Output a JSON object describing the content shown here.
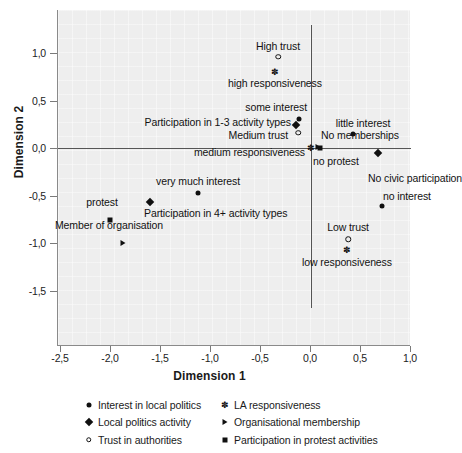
{
  "chart_data": {
    "type": "scatter",
    "title": "",
    "xlabel": "Dimension 1",
    "ylabel": "Dimension 2",
    "xlim": [
      -2.5,
      1.0
    ],
    "ylim": [
      -1.75,
      1.2
    ],
    "xticks": [
      "-2,5",
      "-2,0",
      "-1,5",
      "-1,0",
      "-0,5",
      "0,0",
      "0,5",
      "1,0"
    ],
    "xtick_values": [
      -2.5,
      -2.0,
      -1.5,
      -1.0,
      -0.5,
      0.0,
      0.5,
      1.0
    ],
    "yticks": [
      "1,0",
      "0,5",
      "0,0",
      "-0,5",
      "-1,0",
      "-1,5"
    ],
    "ytick_values": [
      1.0,
      0.5,
      0.0,
      -0.5,
      -1.0,
      -1.5
    ],
    "grid": false,
    "plot_background": "#eeeeee",
    "marker_color": "#101010",
    "origin_lines": true,
    "legend_position": "bottom",
    "points": [
      {
        "label": "High trust",
        "x": -0.33,
        "y": 0.96,
        "marker": "circle-open",
        "series": "Trust in authorities",
        "label_pos": "above-center"
      },
      {
        "label": "high responsiveness",
        "x": -0.36,
        "y": 0.8,
        "marker": "star",
        "series": "LA responsiveness",
        "label_pos": "below-center"
      },
      {
        "label": "some interest",
        "x": -0.12,
        "y": 0.31,
        "marker": "circle-filled",
        "series": "Interest in local politics",
        "label_pos": "above-left"
      },
      {
        "label": "Participation in 1-3 activity types",
        "x": -0.15,
        "y": 0.24,
        "marker": "diamond",
        "series": "Local politics activity",
        "label_pos": "left"
      },
      {
        "label": "Medium trust",
        "x": -0.13,
        "y": 0.16,
        "marker": "circle-open",
        "series": "Trust in authorities",
        "label_pos": "below-left"
      },
      {
        "label": "No memberships",
        "x": 0.07,
        "y": 0.01,
        "marker": "triangle",
        "series": "Organisational membership",
        "label_pos": "above-right"
      },
      {
        "label": "little interest",
        "x": 0.42,
        "y": 0.15,
        "marker": "circle-filled",
        "series": "Interest in local politics",
        "label_pos": "above-center"
      },
      {
        "label": "medium responsiveness",
        "x": 0.0,
        "y": 0.0,
        "marker": "star",
        "series": "LA responsiveness",
        "label_pos": "below-left"
      },
      {
        "label": "no protest",
        "x": 0.09,
        "y": 0.0,
        "marker": "square",
        "series": "Participation in protest activities",
        "label_pos": "below-right"
      },
      {
        "label": "No civic participation",
        "x": 0.67,
        "y": -0.05,
        "marker": "diamond",
        "series": "Local politics activity",
        "label_pos": "below-right"
      },
      {
        "label": "very much interest",
        "x": -1.13,
        "y": -0.47,
        "marker": "circle-filled",
        "series": "Interest in local politics",
        "label_pos": "above-center"
      },
      {
        "label": "no interest",
        "x": 0.71,
        "y": -0.61,
        "marker": "circle-filled",
        "series": "Interest in local politics",
        "label_pos": "above-right"
      },
      {
        "label": "Participation in 4+ activity types",
        "x": -1.61,
        "y": -0.57,
        "marker": "diamond",
        "series": "Local politics activity",
        "label_pos": "below-right"
      },
      {
        "label": "protest",
        "x": -2.01,
        "y": -0.76,
        "marker": "square",
        "series": "Participation in protest activities",
        "label_pos": "above-center"
      },
      {
        "label": "Member of organisation",
        "x": -1.88,
        "y": -1.0,
        "marker": "triangle",
        "series": "Organisational membership",
        "label_pos": "above-center"
      },
      {
        "label": "Low trust",
        "x": 0.37,
        "y": -0.96,
        "marker": "circle-open",
        "series": "Trust in authorities",
        "label_pos": "above-center"
      },
      {
        "label": "low responsiveness",
        "x": 0.36,
        "y": -1.07,
        "marker": "star",
        "series": "LA responsiveness",
        "label_pos": "below-center"
      }
    ],
    "legend": [
      {
        "label": "Interest in local politics",
        "marker": "circle-filled"
      },
      {
        "label": "LA responsiveness",
        "marker": "star"
      },
      {
        "label": "Local politics activity",
        "marker": "diamond"
      },
      {
        "label": "Organisational membership",
        "marker": "triangle"
      },
      {
        "label": "Trust in authorities",
        "marker": "circle-open"
      },
      {
        "label": "Participation in protest activities",
        "marker": "square"
      }
    ]
  }
}
